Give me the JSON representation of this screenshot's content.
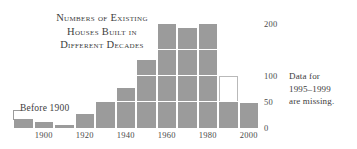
{
  "chart_data": {
    "type": "bar",
    "title": "Numbers of Existing\nHouses Built in\nDifferent Decades",
    "xlabel": "",
    "ylabel": "",
    "ylim": [
      0,
      215
    ],
    "grid": true,
    "gridlines": [
      50,
      100,
      150
    ],
    "legend": "none",
    "categories": [
      "Before 1900",
      "1900s",
      "1910s",
      "1920s",
      "1930s",
      "1940s",
      "1950s",
      "1960s",
      "1970s",
      "1980s",
      "1990s",
      "2000s"
    ],
    "values": [
      18,
      12,
      6,
      26,
      52,
      76,
      130,
      200,
      192,
      200,
      112,
      48
    ],
    "bar_notes": [
      "",
      "",
      "",
      "",
      "",
      "",
      "",
      "",
      "",
      "",
      "partial: gray to 50, hollow outline from 50 to 100 (missing data)",
      ""
    ],
    "ghost_segment": {
      "category_index": 10,
      "from": 50,
      "to": 100
    },
    "y_ticks": [
      {
        "value": 200,
        "label": "200"
      },
      {
        "value": 100,
        "label": "100"
      },
      {
        "value": 50,
        "label": "50"
      },
      {
        "value": 0,
        "label": "0"
      }
    ],
    "x_ticks": [
      {
        "label": "1900",
        "category_index": 1
      },
      {
        "label": "1920",
        "category_index": 3
      },
      {
        "label": "1940",
        "category_index": 5
      },
      {
        "label": "1960",
        "category_index": 7
      },
      {
        "label": "1980",
        "category_index": 9
      },
      {
        "label": "2000",
        "category_index": 11
      }
    ],
    "annotations": [
      {
        "name": "before-1900-callout",
        "text": "Before 1900"
      },
      {
        "name": "missing-data-note",
        "text": "Data for\n1995–1999\nare missing."
      }
    ],
    "colors": {
      "bar": "#9b9b9b",
      "gridline": "#ffffff",
      "ghost_border": "#b9b9b9",
      "text": "#3d3d3d",
      "background": "#ffffff"
    }
  }
}
